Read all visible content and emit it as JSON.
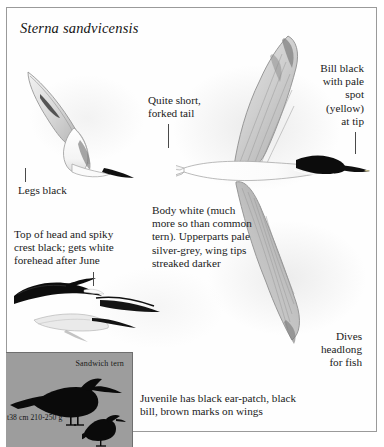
{
  "plate": {
    "title": "Sterna sandvicensis",
    "border_color": "#9a9a9a",
    "background_color": "#ffffff"
  },
  "annotations": [
    {
      "id": "tail",
      "text": "Quite short,\nforked tail"
    },
    {
      "id": "bill",
      "text": "Bill black\nwith pale\nspot\n(yellow)\nat tip"
    },
    {
      "id": "legs",
      "text": "Legs black"
    },
    {
      "id": "crest",
      "text": "Top of head and spiky\ncrest black; gets white\nforehead after June"
    },
    {
      "id": "body",
      "text": "Body white (much\nmore so than common\ntern). Upperparts pale\nsilver-grey, wing tips\nstreaked darker"
    },
    {
      "id": "dives",
      "text": "Dives\nheadlong\nfor fish"
    },
    {
      "id": "juvenile",
      "text": "Juvenile has black ear-patch, black\nbill, brown marks on wings"
    }
  ],
  "inset": {
    "panel_color": "#9d9d9d",
    "species_label": "Sandwich tern",
    "measurements": "t38 cm  210-250 g"
  },
  "illustrations": [
    {
      "id": "plunging-tern",
      "label": "tern plunge-diving, upper left"
    },
    {
      "id": "flying-tern",
      "label": "tern in flight, wings spread, centre right"
    },
    {
      "id": "head-sketches",
      "label": "two head and wing sketches, mid left"
    },
    {
      "id": "silhouette-tern",
      "label": "black standing tern silhouette in inset"
    },
    {
      "id": "silhouette-small",
      "label": "small black perching bird silhouette in inset"
    }
  ]
}
